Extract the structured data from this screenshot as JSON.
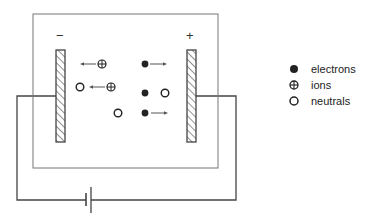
{
  "diagram": {
    "colors": {
      "line": "#444444",
      "plate_fill": "#ffffff",
      "hatch": "#555555",
      "particle": "#222222",
      "background": "#ffffff"
    },
    "chamber": {
      "x": 33,
      "y": 14,
      "w": 185,
      "h": 154
    },
    "electrodes": [
      {
        "id": "cathode",
        "polarity": "−",
        "x": 56,
        "y": 50,
        "w": 9,
        "h": 92,
        "label_x": 56,
        "label_y": 29
      },
      {
        "id": "anode",
        "polarity": "+",
        "x": 187,
        "y": 50,
        "w": 9,
        "h": 92,
        "label_x": 186,
        "label_y": 29
      }
    ],
    "circuit": {
      "wire_y_top": 96,
      "left_x": 17,
      "right_x": 236,
      "bottom_y": 200,
      "battery": {
        "short_plate_x": 86,
        "short_top": 193,
        "short_bottom": 206,
        "long_plate_x": 91,
        "long_top": 187,
        "long_bottom": 213
      }
    },
    "particles": [
      {
        "type": "ion",
        "cx": 102,
        "cy": 64,
        "arrow": {
          "x1": 96,
          "x2": 80
        }
      },
      {
        "type": "neutral",
        "cx": 80,
        "cy": 87
      },
      {
        "type": "ion",
        "cx": 111,
        "cy": 87,
        "arrow": {
          "x1": 105,
          "x2": 89
        }
      },
      {
        "type": "electron",
        "cx": 145,
        "cy": 64,
        "arrow": {
          "x1": 150,
          "x2": 167
        }
      },
      {
        "type": "electron",
        "cx": 145,
        "cy": 93
      },
      {
        "type": "neutral",
        "cx": 165,
        "cy": 93
      },
      {
        "type": "neutral",
        "cx": 118,
        "cy": 113
      },
      {
        "type": "electron",
        "cx": 145,
        "cy": 113,
        "arrow": {
          "x1": 151,
          "x2": 168
        }
      }
    ]
  },
  "legend": {
    "items": [
      {
        "symbol": "electron",
        "label": "electrons",
        "y": 62
      },
      {
        "symbol": "ion",
        "label": "ions",
        "y": 78
      },
      {
        "symbol": "neutral",
        "label": "neutrals",
        "y": 94
      }
    ]
  }
}
